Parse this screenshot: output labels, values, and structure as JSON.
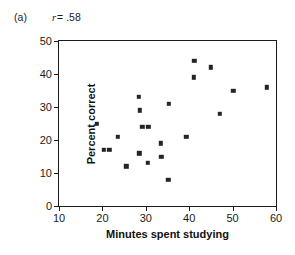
{
  "figure": {
    "panel_letter": "(a)",
    "correlation_symbol": "r",
    "correlation_text": "= .58",
    "marker_color": "#242424",
    "axis_color": "#1a1a1a"
  },
  "chart_data": {
    "type": "scatter",
    "title": "",
    "panel": "(a)",
    "annotations": [
      {
        "text": "r = .58",
        "kind": "correlation",
        "value": 0.58
      }
    ],
    "xlabel": "Minutes spent studying",
    "ylabel": "Percent correct",
    "xlim": [
      10,
      60
    ],
    "ylim": [
      0,
      50
    ],
    "xticks": [
      10,
      20,
      30,
      40,
      50,
      60
    ],
    "yticks": [
      0,
      10,
      20,
      30,
      40,
      50
    ],
    "xticklabels": [
      "10",
      "20",
      "30",
      "40",
      "50",
      "60"
    ],
    "yticklabels": [
      "0",
      "10",
      "20",
      "30",
      "40",
      "50"
    ],
    "grid": false,
    "legend": null,
    "marker": "square",
    "n_points": 22,
    "points": [
      {
        "x": 18.7,
        "y": 25
      },
      {
        "x": 20.3,
        "y": 17
      },
      {
        "x": 21.6,
        "y": 17
      },
      {
        "x": 23.5,
        "y": 21
      },
      {
        "x": 25.5,
        "y": 12
      },
      {
        "x": 28.4,
        "y": 33
      },
      {
        "x": 28.6,
        "y": 29
      },
      {
        "x": 28.5,
        "y": 16
      },
      {
        "x": 29.2,
        "y": 24
      },
      {
        "x": 30.4,
        "y": 13
      },
      {
        "x": 33.4,
        "y": 19
      },
      {
        "x": 33.6,
        "y": 15
      },
      {
        "x": 35.3,
        "y": 31
      },
      {
        "x": 35.2,
        "y": 8
      },
      {
        "x": 39.3,
        "y": 21
      },
      {
        "x": 41.2,
        "y": 44
      },
      {
        "x": 41.1,
        "y": 39
      },
      {
        "x": 45.0,
        "y": 42
      },
      {
        "x": 47.0,
        "y": 28
      },
      {
        "x": 50.2,
        "y": 35
      },
      {
        "x": 57.9,
        "y": 36
      },
      {
        "x": 30.6,
        "y": 24
      }
    ]
  }
}
